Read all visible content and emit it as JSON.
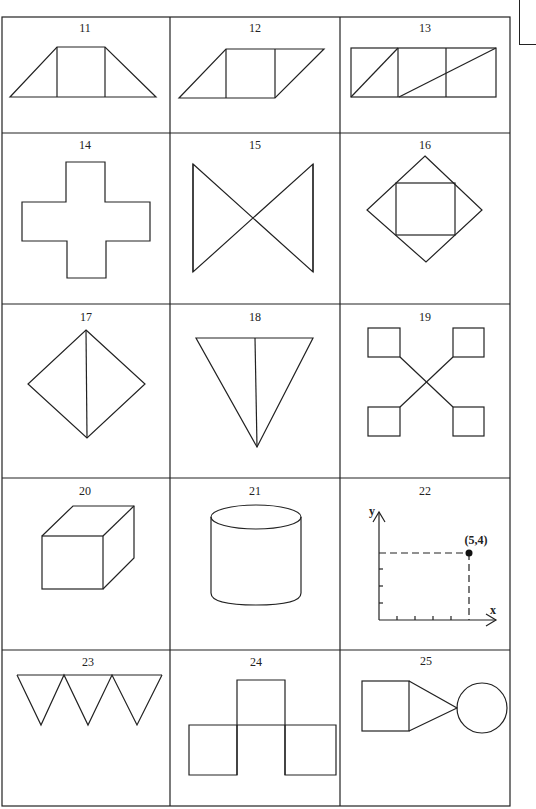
{
  "page": {
    "colors": {
      "stroke": "#222222",
      "background": "#ffffff"
    }
  },
  "cells": [
    {
      "number": "11",
      "shape": "trapezoid-with-inner-square"
    },
    {
      "number": "12",
      "shape": "parallelogram-with-inner-square"
    },
    {
      "number": "13",
      "shape": "three-squares-with-diagonals"
    },
    {
      "number": "14",
      "shape": "plus-cross"
    },
    {
      "number": "15",
      "shape": "bowtie"
    },
    {
      "number": "16",
      "shape": "diamond-with-inner-square"
    },
    {
      "number": "17",
      "shape": "diamond-with-vertical-line"
    },
    {
      "number": "18",
      "shape": "inverted-triangle-with-center-line"
    },
    {
      "number": "19",
      "shape": "four-squares-connected-by-x"
    },
    {
      "number": "20",
      "shape": "cube"
    },
    {
      "number": "21",
      "shape": "cylinder"
    },
    {
      "number": "22",
      "shape": "coordinate-plot-point",
      "axis_x_label": "x",
      "axis_y_label": "y",
      "point_label": "(5,4)"
    },
    {
      "number": "23",
      "shape": "three-inverted-triangles"
    },
    {
      "number": "24",
      "shape": "inverted-t-of-squares"
    },
    {
      "number": "25",
      "shape": "square-triangle-circle"
    }
  ]
}
